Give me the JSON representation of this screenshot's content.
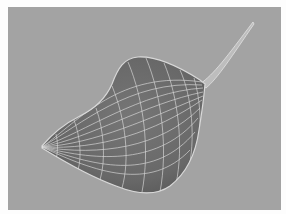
{
  "image": {
    "subject": "3D wireframe surface model of a gourd-like organic shape with a thin stem",
    "colors": {
      "frame": "#fdfdfd",
      "background": "#a3a3a3",
      "surface": "#6e6e6e",
      "surface_shadow": "#5a5a5a",
      "wire": "#e6e6e6",
      "rim_highlight": "#d8d8d8"
    }
  }
}
